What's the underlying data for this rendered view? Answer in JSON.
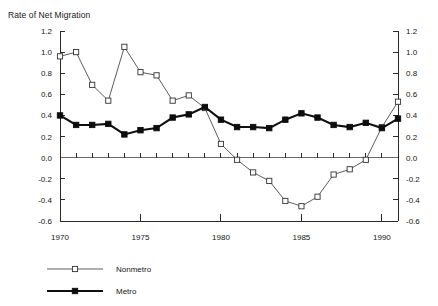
{
  "chart_data": {
    "type": "line",
    "title": "Rate of Net Migration",
    "xlabel": "",
    "ylabel": "",
    "ylim": [
      -0.6,
      1.2
    ],
    "ytick_step": 0.2,
    "xlim": [
      1970,
      1991
    ],
    "grid": false,
    "legend_position": "bottom-left",
    "dual_y_axis": true,
    "x": [
      1970,
      1971,
      1972,
      1973,
      1974,
      1975,
      1976,
      1977,
      1978,
      1979,
      1980,
      1981,
      1982,
      1983,
      1984,
      1985,
      1986,
      1987,
      1988,
      1989,
      1990,
      1991
    ],
    "xticks": [
      1970,
      1975,
      1980,
      1985,
      1990
    ],
    "xtick_labels": [
      "1970",
      "1975",
      "1980",
      "1985",
      "1990"
    ],
    "yticks": [
      -0.6,
      -0.4,
      -0.2,
      0.0,
      0.2,
      0.4,
      0.6,
      0.8,
      1.0,
      1.2
    ],
    "ytick_labels": [
      "-0.6",
      "-0.4",
      "-0.2",
      "0.0",
      "0.2",
      "0.4",
      "0.6",
      "0.8",
      "1.0",
      "1.2"
    ],
    "series": [
      {
        "name": "Nonmetro",
        "marker": "open-square",
        "values": [
          0.96,
          1.0,
          0.69,
          0.54,
          1.05,
          0.81,
          0.78,
          0.54,
          0.59,
          0.47,
          0.13,
          -0.02,
          -0.14,
          -0.22,
          -0.41,
          -0.46,
          -0.37,
          -0.16,
          -0.11,
          -0.02,
          0.29,
          0.53
        ]
      },
      {
        "name": "Metro",
        "marker": "filled-square",
        "values": [
          0.4,
          0.31,
          0.31,
          0.32,
          0.22,
          0.26,
          0.28,
          0.38,
          0.41,
          0.48,
          0.36,
          0.29,
          0.29,
          0.28,
          0.36,
          0.42,
          0.38,
          0.31,
          0.29,
          0.33,
          0.28,
          0.37
        ]
      }
    ]
  },
  "legend": {
    "items": [
      {
        "label": "Nonmetro",
        "marker": "open-square"
      },
      {
        "label": "Metro",
        "marker": "filled-square"
      }
    ]
  }
}
